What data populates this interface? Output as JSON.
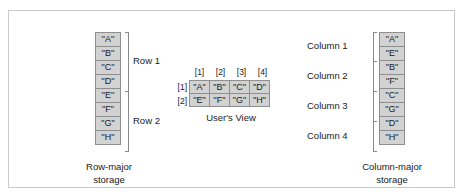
{
  "figure": {
    "colors": {
      "cell_fill": "#d2d2d2",
      "cell_border": "#8f8f8f",
      "frame_border": "#c9c9c9",
      "text": "#1a1a1a",
      "bracket": "#8a8a8a"
    }
  },
  "row_major": {
    "caption_line1": "Row-major",
    "caption_line2": "storage",
    "cells": [
      "\"A\"",
      "\"B\"",
      "\"C\"",
      "\"D\"",
      "\"E\"",
      "\"F\"",
      "\"G\"",
      "\"H\""
    ],
    "group_labels": [
      "Row 1",
      "Row 2"
    ]
  },
  "users_view": {
    "caption": "User's View",
    "column_indices": [
      "[1]",
      "[2]",
      "[3]",
      "[4]"
    ],
    "row_indices": [
      "[1]",
      "[2]"
    ],
    "rows": [
      [
        "\"A\"",
        "\"B\"",
        "\"C\"",
        "\"D\""
      ],
      [
        "\"E\"",
        "\"F\"",
        "\"G\"",
        "\"H\""
      ]
    ]
  },
  "column_major": {
    "caption_line1": "Column-major",
    "caption_line2": "storage",
    "cells": [
      "\"A\"",
      "\"E\"",
      "\"B\"",
      "\"F\"",
      "\"C\"",
      "\"G\"",
      "\"D\"",
      "\"H\""
    ],
    "group_labels": [
      "Column 1",
      "Column 2",
      "Column 3",
      "Column 4"
    ]
  }
}
